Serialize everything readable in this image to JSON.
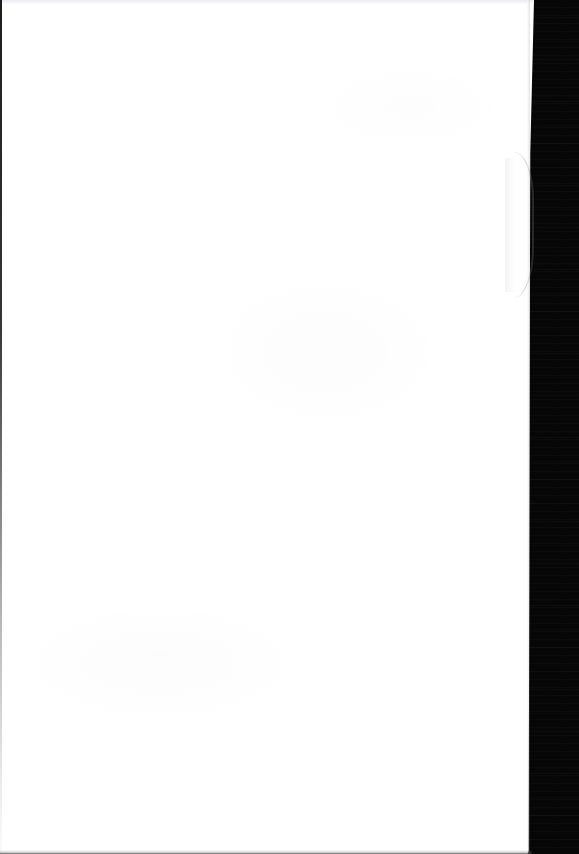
{
  "view": {
    "title": "Blank Page",
    "status_text": "",
    "page_label": ""
  },
  "page": {
    "content_text": "",
    "background_color": "#ffffff",
    "is_blank": true
  },
  "backdrop": {
    "color": "#050505",
    "label": "dark-backdrop"
  },
  "edges": {
    "left_border_color": "#0a0a0a",
    "top_band_color": "#e9eaee",
    "bottom_line_color": "#282828",
    "seam_color": "#3c3c3c"
  },
  "bulge": {
    "label": "page-curl",
    "color": "#ffffff",
    "shade_color": "#787878"
  }
}
